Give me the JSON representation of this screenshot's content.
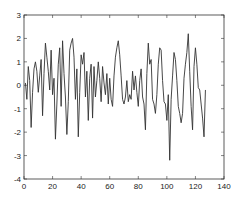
{
  "chart_data": {
    "type": "line",
    "title": "",
    "xlabel": "",
    "ylabel": "",
    "xlim": [
      0,
      140
    ],
    "ylim": [
      -4,
      3
    ],
    "grid": false,
    "legend": null,
    "x_ticks": [
      0,
      20,
      40,
      60,
      80,
      100,
      120,
      140
    ],
    "y_ticks": [
      -4,
      -3,
      -2,
      -1,
      0,
      1,
      2,
      3
    ],
    "x_tick_labels": [
      "0",
      "20",
      "40",
      "60",
      "80",
      "100",
      "120",
      "140"
    ],
    "y_tick_labels": [
      "-4",
      "-3",
      "-2",
      "-1",
      "0",
      "1",
      "2",
      "3"
    ],
    "line_color": "#333333",
    "series": [
      {
        "name": "signal",
        "x": [
          1,
          2,
          3,
          4,
          5,
          6,
          7,
          8,
          9,
          10,
          11,
          12,
          13,
          14,
          15,
          16,
          17,
          18,
          19,
          20,
          21,
          22,
          23,
          24,
          25,
          26,
          27,
          28,
          29,
          30,
          31,
          32,
          33,
          34,
          35,
          36,
          37,
          38,
          39,
          40,
          41,
          42,
          43,
          44,
          45,
          46,
          47,
          48,
          49,
          50,
          51,
          52,
          53,
          54,
          55,
          56,
          57,
          58,
          59,
          60,
          61,
          62,
          63,
          64,
          65,
          66,
          67,
          68,
          69,
          70,
          71,
          72,
          73,
          74,
          75,
          76,
          77,
          78,
          79,
          80,
          81,
          82,
          83,
          84,
          85,
          86,
          87,
          88,
          89,
          90,
          91,
          92,
          93,
          94,
          95,
          96,
          97,
          98,
          99,
          100,
          101,
          102,
          103,
          104,
          105,
          106,
          107,
          108,
          109,
          110,
          111,
          112,
          113,
          114,
          115,
          116,
          117,
          118,
          119,
          120,
          121,
          122,
          123,
          124,
          125,
          126,
          127
        ],
        "values": [
          0.1,
          -0.6,
          0.8,
          0.2,
          -1.8,
          -0.3,
          0.7,
          1.0,
          0.6,
          -0.3,
          0.4,
          1.1,
          -1.3,
          0.5,
          1.8,
          1.2,
          0.6,
          -0.2,
          1.5,
          -0.4,
          0.3,
          -2.3,
          -0.8,
          0.9,
          1.6,
          -0.9,
          1.9,
          0.5,
          -0.5,
          -2.1,
          -0.7,
          1.5,
          1.8,
          2.0,
          1.2,
          -0.6,
          0.7,
          -2.2,
          -0.3,
          1.3,
          0.9,
          1.4,
          -0.5,
          0.6,
          -1.5,
          0.3,
          0.9,
          -1.4,
          0.8,
          -0.5,
          0.2,
          1.0,
          0.3,
          -0.7,
          0.8,
          0.1,
          -0.4,
          0.5,
          -0.8,
          0.3,
          -0.6,
          -0.9,
          0.4,
          1.2,
          1.6,
          1.9,
          1.3,
          0.4,
          -0.6,
          -0.8,
          -0.5,
          0.2,
          -0.7,
          -0.4,
          -0.6,
          0.6,
          -0.2,
          0.4,
          -0.3,
          -0.9,
          0.2,
          0.7,
          -0.5,
          -0.8,
          -1.9,
          0.5,
          1.8,
          0.9,
          1.1,
          -0.6,
          -0.8,
          -1.2,
          -0.4,
          0.9,
          1.6,
          1.5,
          0.2,
          -0.7,
          -0.8,
          -1.5,
          -0.4,
          -3.2,
          -0.6,
          0.4,
          1.4,
          1.1,
          0.2,
          -0.9,
          -1.2,
          -1.6,
          -1.2,
          0.3,
          0.9,
          1.4,
          2.2,
          0.6,
          -0.9,
          -1.9,
          0.8,
          1.6,
          0.9,
          -0.1,
          -0.2,
          -0.8,
          -1.4,
          -2.2,
          -0.2
        ]
      }
    ]
  }
}
